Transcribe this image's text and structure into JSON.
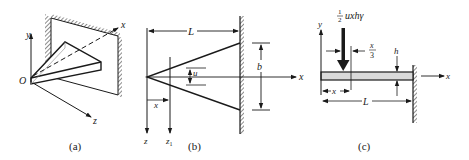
{
  "figure": {
    "panels": [
      {
        "id": "a",
        "caption": "(a)",
        "labels": {
          "origin": "O",
          "x_axis": "x",
          "y_axis": "y",
          "z_axis": "z"
        }
      },
      {
        "id": "b",
        "caption": "(b)",
        "labels": {
          "length": "L",
          "width": "b",
          "local_width": "u",
          "x_axis": "x",
          "z_axis": "z",
          "z1_axis": "z",
          "z1_sub": "1",
          "position": "x"
        }
      },
      {
        "id": "c",
        "caption": "(c)",
        "labels": {
          "load_frac_num": "1",
          "load_frac_den": "2",
          "load_expr": "uxhγ",
          "offset_num": "x",
          "offset_den": "3",
          "thickness": "h",
          "x_axis": "x",
          "y_axis": "y",
          "position": "x",
          "length": "L"
        }
      }
    ],
    "colors": {
      "ink": "#1a1a1a",
      "beam_fill": "#d9d9d9",
      "background": "#ffffff"
    }
  }
}
